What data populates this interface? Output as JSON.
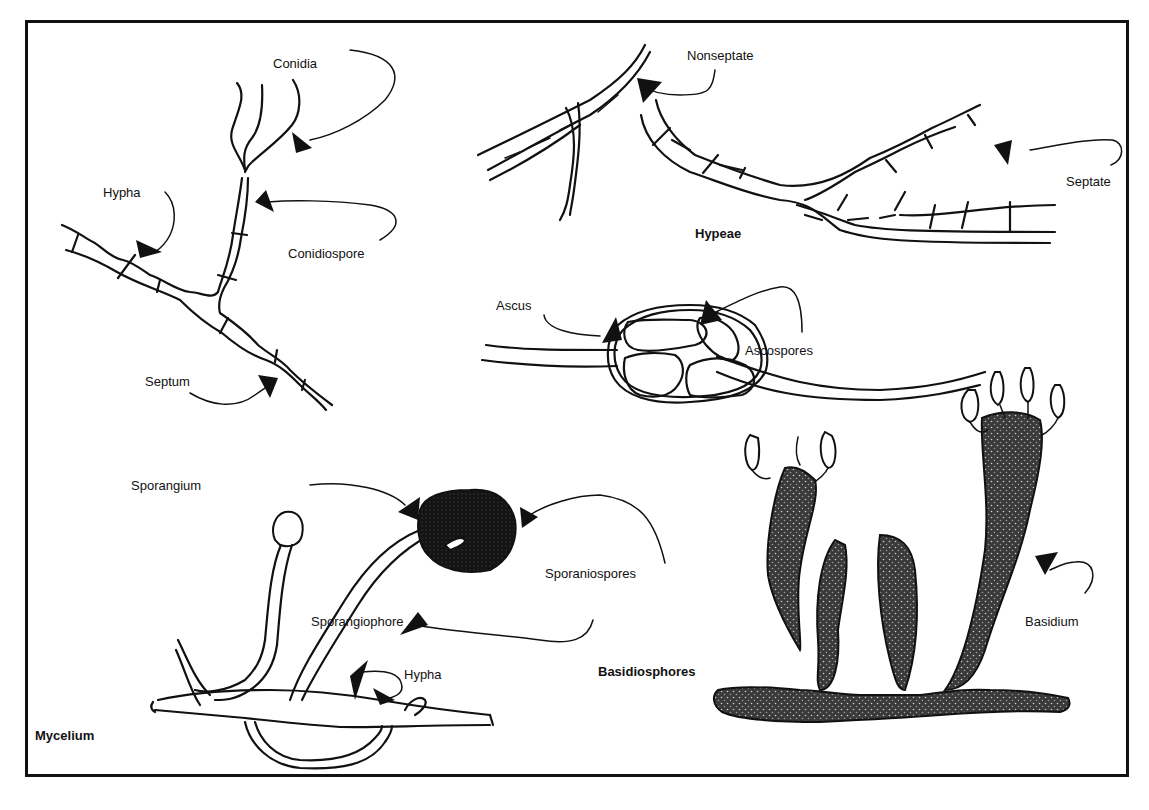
{
  "figure": {
    "panels": {
      "conidia_panel": {
        "labels": {
          "conidia": "Conidia",
          "hypha": "Hypha",
          "conidiospore": "Conidiospore",
          "septum": "Septum"
        }
      },
      "hyphae_panel": {
        "caption": "Hypeae",
        "labels": {
          "nonseptate": "Nonseptate",
          "septate": "Septate"
        }
      },
      "ascus_panel": {
        "labels": {
          "ascus": "Ascus",
          "ascospores": "Ascospores"
        }
      },
      "mycelium_panel": {
        "caption": "Mycelium",
        "labels": {
          "sporangium": "Sporangium",
          "sporaniospores": "Sporaniospores",
          "sporangiophore": "Sporangiophore",
          "hypha": "Hypha"
        }
      },
      "basidium_panel": {
        "caption": "Basidiosphores",
        "labels": {
          "basidium": "Basidium"
        }
      }
    }
  }
}
